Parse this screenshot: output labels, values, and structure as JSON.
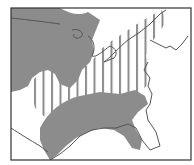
{
  "map": {
    "region": "Eastern United States and southern Canada",
    "legend": [],
    "colors": {
      "background": "#ffffff",
      "range_fill": "#8c8c8c",
      "stripe": "#8c8c8c",
      "border": "#333333",
      "coast": "#555555"
    },
    "layers": [
      {
        "name": "solid-range-north",
        "pattern": "solid gray"
      },
      {
        "name": "solid-range-south",
        "pattern": "solid gray"
      },
      {
        "name": "striped-range-middle",
        "pattern": "vertical stripes"
      }
    ]
  }
}
